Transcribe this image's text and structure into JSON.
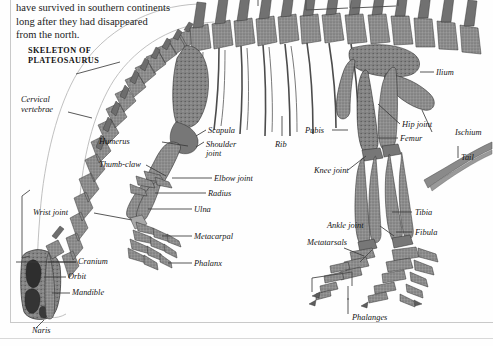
{
  "page": {
    "background_color": "#fefefe",
    "ink_color": "#1a1a1a",
    "bone_color": "#8d8d8d",
    "leader_color": "#3a3a3a"
  },
  "body_text": {
    "line1": "have survived in southern continents",
    "line2": "long after they had disappeared",
    "line3": "from the north."
  },
  "figure": {
    "title_line1": "SKELETON OF",
    "title_line2": "PLATEOSAURUS"
  },
  "labels": [
    {
      "id": "cervical-vertebrae",
      "line1": "Cervical",
      "line2": "vertebrae"
    },
    {
      "id": "humerus",
      "line1": "Humerus"
    },
    {
      "id": "thumb-claw",
      "line1": "Thumb-claw"
    },
    {
      "id": "wrist-joint",
      "line1": "Wrist joint"
    },
    {
      "id": "cranium",
      "line1": "Cranium"
    },
    {
      "id": "orbit",
      "line1": "Orbit"
    },
    {
      "id": "mandible",
      "line1": "Mandible"
    },
    {
      "id": "naris",
      "line1": "Naris"
    },
    {
      "id": "scapula",
      "line1": "Scapula"
    },
    {
      "id": "shoulder-joint",
      "line1": "Shoulder",
      "line2": "joint"
    },
    {
      "id": "elbow-joint",
      "line1": "Elbow joint"
    },
    {
      "id": "radius",
      "line1": "Radius"
    },
    {
      "id": "ulna",
      "line1": "Ulna"
    },
    {
      "id": "metacarpal",
      "line1": "Metacarpal"
    },
    {
      "id": "phalanx",
      "line1": "Phalanx"
    },
    {
      "id": "rib",
      "line1": "Rib"
    },
    {
      "id": "pubis",
      "line1": "Pubis"
    },
    {
      "id": "ilium",
      "line1": "Ilium"
    },
    {
      "id": "hip-joint",
      "line1": "Hip joint"
    },
    {
      "id": "ischium",
      "line1": "Ischium"
    },
    {
      "id": "femur",
      "line1": "Femur"
    },
    {
      "id": "tail",
      "line1": "Tail"
    },
    {
      "id": "knee-joint",
      "line1": "Knee joint"
    },
    {
      "id": "tibia",
      "line1": "Tibia"
    },
    {
      "id": "fibula",
      "line1": "Fibula"
    },
    {
      "id": "ankle-joint",
      "line1": "Ankle joint"
    },
    {
      "id": "metatarsals",
      "line1": "Metatarsals"
    },
    {
      "id": "phalanges",
      "line1": "Phalanges"
    }
  ]
}
